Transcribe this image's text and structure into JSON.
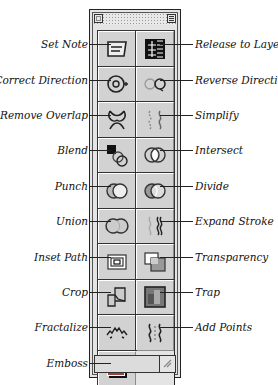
{
  "palette": {
    "title": "Plug-in Tools",
    "left_labels": [
      {
        "label": "Set Note",
        "y": 44
      },
      {
        "label": "Correct Direction",
        "y": 80
      },
      {
        "label": "Remove Overlap",
        "y": 115
      },
      {
        "label": "Blend",
        "y": 150
      },
      {
        "label": "Punch",
        "y": 186
      },
      {
        "label": "Union",
        "y": 221
      },
      {
        "label": "Inset Path",
        "y": 257
      },
      {
        "label": "Crop",
        "y": 292
      },
      {
        "label": "Fractalize",
        "y": 327
      },
      {
        "label": "Emboss",
        "y": 363
      }
    ],
    "right_labels": [
      {
        "label": "Release to Layers",
        "y": 44
      },
      {
        "label": "Reverse Direction",
        "y": 80
      },
      {
        "label": "Simplify",
        "y": 115
      },
      {
        "label": "Intersect",
        "y": 150
      },
      {
        "label": "Divide",
        "y": 186
      },
      {
        "label": "Expand Stroke",
        "y": 221
      },
      {
        "label": "Transparency",
        "y": 257
      },
      {
        "label": "Trap",
        "y": 292
      },
      {
        "label": "Add Points",
        "y": 327
      }
    ],
    "tools": [
      {
        "name": "set-note",
        "icon": "note-icon"
      },
      {
        "name": "release-to-layers",
        "icon": "layers-icon"
      },
      {
        "name": "correct-direction",
        "icon": "correct-direction-icon"
      },
      {
        "name": "reverse-direction",
        "icon": "reverse-direction-icon"
      },
      {
        "name": "remove-overlap",
        "icon": "remove-overlap-icon"
      },
      {
        "name": "simplify",
        "icon": "simplify-icon"
      },
      {
        "name": "blend",
        "icon": "blend-icon"
      },
      {
        "name": "intersect",
        "icon": "intersect-icon"
      },
      {
        "name": "punch",
        "icon": "punch-icon"
      },
      {
        "name": "divide",
        "icon": "divide-icon"
      },
      {
        "name": "union",
        "icon": "union-icon"
      },
      {
        "name": "expand-stroke",
        "icon": "expand-stroke-icon"
      },
      {
        "name": "inset-path",
        "icon": "inset-path-icon"
      },
      {
        "name": "transparency",
        "icon": "transparency-icon"
      },
      {
        "name": "crop",
        "icon": "crop-icon"
      },
      {
        "name": "trap",
        "icon": "trap-icon"
      },
      {
        "name": "fractalize",
        "icon": "fractalize-icon"
      },
      {
        "name": "add-points",
        "icon": "add-points-icon"
      },
      {
        "name": "emboss",
        "icon": "emboss-icon"
      }
    ],
    "colors": {
      "panel": "#e4e4e4",
      "cell": "#d2d2d2",
      "frame": "#222222",
      "emboss_fill": "#a0403a"
    }
  }
}
